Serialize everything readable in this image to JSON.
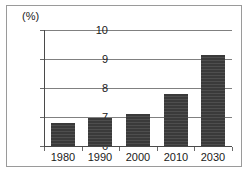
{
  "chart_data": {
    "type": "bar",
    "title": "",
    "subtitle": "",
    "xlabel": "",
    "ylabel": "(%)",
    "unit_label": "(%)",
    "categories": [
      "1980",
      "1990",
      "2000",
      "2010",
      "2030"
    ],
    "values": [
      6.8,
      6.95,
      7.1,
      7.8,
      9.15
    ],
    "series": [
      {
        "name": "",
        "values": [
          6.8,
          6.95,
          7.1,
          7.8,
          9.15
        ]
      }
    ],
    "ylim": [
      6,
      10
    ],
    "yticks": [
      "6",
      "7",
      "8",
      "9",
      "10"
    ],
    "ytick_values": [
      6,
      7,
      8,
      9,
      10
    ],
    "grid": true,
    "grid_orientation": "horizontal",
    "legend": false,
    "legend_position": "none",
    "bar_color": "#3a3a3a",
    "grid_color": "#808080",
    "axis_color": "#4a4a4a",
    "frame_color": "#9a9a9a",
    "background": "#ffffff"
  }
}
